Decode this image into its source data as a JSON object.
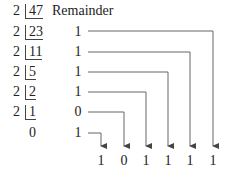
{
  "header": {
    "remainder_label": "Remainder"
  },
  "divisor": "2",
  "rows": [
    {
      "divisor": "2",
      "dividend": "47",
      "remainder": ""
    },
    {
      "divisor": "2",
      "dividend": "23",
      "remainder": "1"
    },
    {
      "divisor": "2",
      "dividend": "11",
      "remainder": "1"
    },
    {
      "divisor": "2",
      "dividend": "5",
      "remainder": "1"
    },
    {
      "divisor": "2",
      "dividend": "2",
      "remainder": "1"
    },
    {
      "divisor": "2",
      "dividend": "1",
      "remainder": "0"
    },
    {
      "divisor": "",
      "dividend": "0",
      "remainder": "1"
    }
  ],
  "result_bits": [
    "1",
    "0",
    "1",
    "1",
    "1",
    "1"
  ],
  "colors": {
    "text": "#222222",
    "lines": "#555555"
  }
}
